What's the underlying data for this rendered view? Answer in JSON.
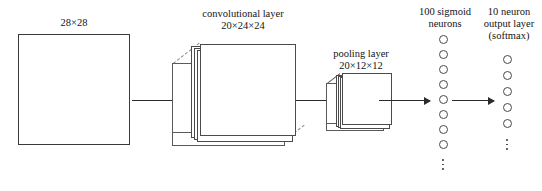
{
  "diagram": {
    "background_color": "#ffffff",
    "stroke_color": "#3a3a3a",
    "dashed_color": "#8a8a8a",
    "labels": {
      "input": "28×28",
      "conv_name": "convolutional layer",
      "conv_dims": "20×24×24",
      "pool_name": "pooling layer",
      "pool_dims": "20×12×12",
      "hidden_line1": "100 sigmoid",
      "hidden_line2": "neurons",
      "output_line1": "10 neuron",
      "output_line2": "output layer",
      "output_line3": "(softmax)"
    },
    "layers": [
      {
        "id": "input",
        "kind": "plane",
        "label": "28×28",
        "width_units": 28,
        "height_units": 28,
        "depth": 1
      },
      {
        "id": "convolutional",
        "kind": "stack",
        "label": "convolutional layer",
        "dims_label": "20×24×24",
        "feature_maps": 20,
        "map_width": 24,
        "map_height": 24,
        "visible_sheets": 4
      },
      {
        "id": "pooling",
        "kind": "stack",
        "label": "pooling layer",
        "dims_label": "20×12×12",
        "feature_maps": 20,
        "map_width": 12,
        "map_height": 12,
        "visible_sheets": 4
      },
      {
        "id": "hidden",
        "kind": "neuron-column",
        "label": "100 sigmoid neurons",
        "neuron_count": 100,
        "visible_neurons": 8,
        "has_ellipsis": true,
        "activation": "sigmoid"
      },
      {
        "id": "output",
        "kind": "neuron-column",
        "label": "10 neuron output layer (softmax)",
        "neuron_count": 10,
        "visible_neurons": 5,
        "has_ellipsis": true,
        "activation": "softmax"
      }
    ],
    "connections": [
      {
        "from": "input",
        "to": "convolutional",
        "style": "arrow"
      },
      {
        "from": "convolutional",
        "to": "pooling",
        "style": "arrow"
      },
      {
        "from": "pooling",
        "to": "hidden",
        "style": "arrow"
      },
      {
        "from": "hidden",
        "to": "output",
        "style": "arrow"
      }
    ]
  }
}
